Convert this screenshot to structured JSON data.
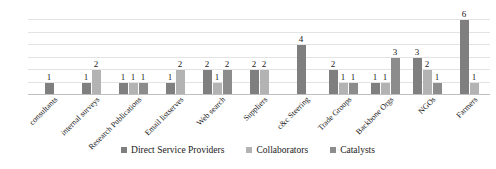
{
  "chart_data": {
    "type": "bar",
    "title": "",
    "subtitle": "",
    "xlabel": "",
    "ylabel": "",
    "ylim": [
      0,
      7
    ],
    "grid": true,
    "gridlines": [
      1,
      2,
      3,
      4,
      5,
      6
    ],
    "y_tick_labels": [],
    "legend_position": "bottom",
    "data_labels": true,
    "categories": [
      "consultants",
      "internal surveys",
      "Research Publications",
      "Email listserves",
      "Web search",
      "Suppliers",
      "c&c Steering",
      "Trade Groups",
      "Backbone Orgs",
      "NGOs",
      "Farmers"
    ],
    "series": [
      {
        "name": "Direct Service Providers",
        "color": "#7f7f7f",
        "values": [
          1,
          1,
          1,
          1,
          2,
          2,
          4,
          2,
          1,
          3,
          6
        ]
      },
      {
        "name": "Collaborators",
        "color": "#b3b3b3",
        "values": [
          null,
          2,
          1,
          2,
          1,
          2,
          null,
          1,
          1,
          2,
          1
        ]
      },
      {
        "name": "Catalysts",
        "color": "#8c8c8c",
        "values": [
          null,
          null,
          1,
          null,
          2,
          null,
          null,
          1,
          3,
          1,
          null
        ]
      }
    ]
  },
  "colors": {
    "gridline": "#e3e3e3",
    "axis": "#bfbfbf",
    "text": "#1a1a1a",
    "background": "#ffffff"
  }
}
